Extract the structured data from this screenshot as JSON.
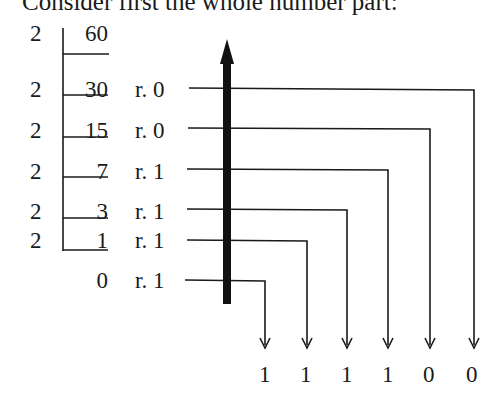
{
  "heading": "Consider first the whole number part:",
  "division": {
    "divisor": "2",
    "rows": [
      {
        "divisor": "2",
        "quotient": "60",
        "remainder": ""
      },
      {
        "divisor": "2",
        "quotient": "30",
        "remainder": "r. 0"
      },
      {
        "divisor": "2",
        "quotient": "15",
        "remainder": "r. 0"
      },
      {
        "divisor": "2",
        "quotient": "7",
        "remainder": "r. 1"
      },
      {
        "divisor": "2",
        "quotient": "3",
        "remainder": "r. 1"
      },
      {
        "divisor": "2",
        "quotient": "1",
        "remainder": "r. 1"
      },
      {
        "divisor": "",
        "quotient": "0",
        "remainder": "r. 1"
      }
    ]
  },
  "result_digits": [
    "1",
    "1",
    "1",
    "1",
    "0",
    "0"
  ],
  "read_direction": "upward"
}
